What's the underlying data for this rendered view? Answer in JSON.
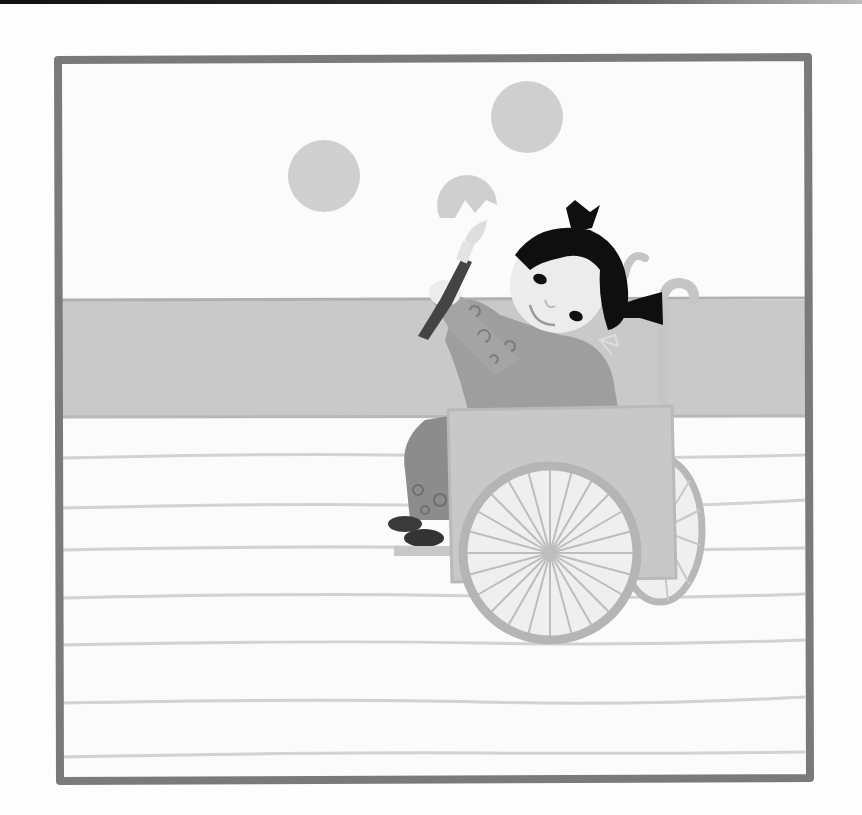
{
  "image": {
    "description": "Grayscale illustration of a girl with black pigtails sitting in a wheelchair, holding a paintbrush and painting circles on a wall",
    "colors": {
      "frame": "#7a7a7a",
      "sky": "#fbfbfb",
      "wall_band": "#c9c9c9",
      "floor": "#fbfbfb",
      "floor_lines": "#d0d0d0",
      "circles": "#cfcfcf",
      "hair": "#0f0f0f",
      "skin": "#ececec",
      "shirt": "#9e9e9e",
      "pants": "#8c8c8c",
      "shoes": "#3a3a3a",
      "chair_panel": "#c8c8c8",
      "wheel": "#b5b5b5",
      "brush_handle": "#444444"
    },
    "elements": {
      "painted_circles": 3,
      "floor_lines": 7,
      "wheel_spokes": 24
    }
  }
}
